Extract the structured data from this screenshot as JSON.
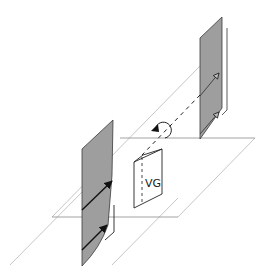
{
  "diagram": {
    "type": "3d-schematic",
    "labels": {
      "vg": "VG"
    },
    "colors": {
      "panel_fill": "#9e9e9e",
      "panel_stroke": "#3a3a3a",
      "thin_line": "#b5b5b5",
      "dark_line": "#222222",
      "background": "#ffffff"
    },
    "elements": [
      {
        "id": "left-panel",
        "kind": "shaded-vertical-plane",
        "arrows": 2,
        "arrow_style": "filled"
      },
      {
        "id": "right-panel",
        "kind": "shaded-vertical-plane",
        "arrows": 2,
        "arrow_style": "hollow"
      },
      {
        "id": "vg-card",
        "kind": "folded-card",
        "label": "VG"
      },
      {
        "id": "rotation-arrow",
        "kind": "circular-arrow"
      },
      {
        "id": "dashed-axis",
        "kind": "dashed-line"
      },
      {
        "id": "ground-planes",
        "kind": "parallelogram-outlines",
        "count": 2
      }
    ]
  }
}
